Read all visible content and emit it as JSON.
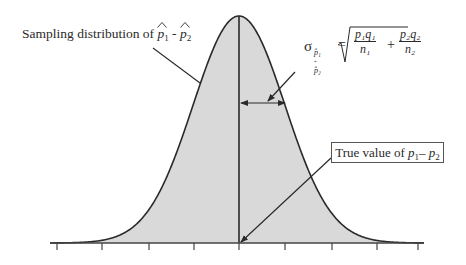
{
  "diagram": {
    "type": "normal-sampling-distribution",
    "curve_color": "#2a2a2a",
    "fill_color": "#d9d9d9",
    "axis_color": "#444444",
    "center_x": 239,
    "baseline_y": 243,
    "peak_y": 16,
    "sigma_px": 46,
    "axis": {
      "x_start": 50,
      "x_end": 424,
      "tick_positions": [
        57,
        102,
        149,
        194,
        239,
        285,
        332,
        377,
        418
      ],
      "tick_length": 7
    }
  },
  "labels": {
    "sampling_prefix": "Sampling distribution of ",
    "p1": "p",
    "p1_sub": "1",
    "minus": " - ",
    "p2": "p",
    "p2_sub": "2",
    "true_value_prefix": "True value of ",
    "true_p1": "p",
    "true_p1_sub": "1",
    "true_minus": "– ",
    "true_p2": "p",
    "true_p2_sub": "2"
  },
  "formula": {
    "sigma": "σ",
    "sigma_subscript": "p̂₁ - p̂₂",
    "equals": "=",
    "term1_numerator": "p₁q₁",
    "term1_denominator": "n₁",
    "plus": "+",
    "term2_numerator": "p₂q₂",
    "term2_denominator": "n₂"
  },
  "annotations": {
    "sampling_arrow": {
      "from": [
        153,
        48
      ],
      "to": [
        200,
        83
      ]
    },
    "sd_double_arrow": {
      "y": 103,
      "x_left": 241,
      "x_right": 285
    },
    "sd_pointer": {
      "from": [
        295,
        72
      ],
      "to": [
        268,
        101
      ]
    },
    "true_value_arrow": {
      "from": [
        331,
        158
      ],
      "to": [
        241,
        242
      ]
    }
  }
}
